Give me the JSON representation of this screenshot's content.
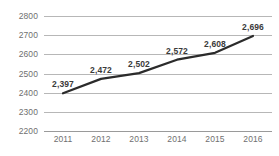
{
  "chart_data": {
    "type": "line",
    "title": "",
    "subtitle": "",
    "xlabel": "",
    "ylabel": "",
    "categories": [
      "2011",
      "2012",
      "2013",
      "2014",
      "2015",
      "2016"
    ],
    "values": [
      2397,
      2472,
      2502,
      2572,
      2608,
      2696
    ],
    "data_labels": [
      "2,397",
      "2,472",
      "2,502",
      "2,572",
      "2,608",
      "2,696"
    ],
    "ylim": [
      2200,
      2800
    ],
    "ytick_values": [
      2800,
      2700,
      2600,
      2500,
      2400,
      2300,
      2200
    ],
    "ytick_labels": [
      "2800",
      "2700",
      "2600",
      "2500",
      "2400",
      "2300",
      "2200"
    ],
    "xtick_labels": [
      "2011",
      "2012",
      "2013",
      "2014",
      "2015",
      "2016"
    ],
    "grid": true,
    "grid_axis": "y",
    "legend": false,
    "legend_position": "none",
    "series": [
      {
        "name": "",
        "values": [
          2397,
          2472,
          2502,
          2572,
          2608,
          2696
        ]
      }
    ]
  },
  "style": {
    "background": "#ffffff",
    "line_color": "#2b2b2b",
    "grid_color": "#b7b7b7",
    "axis_color": "#9a9a9a",
    "tick_label_color": "#6f6f6f",
    "data_label_color": "#3a3a3a"
  }
}
